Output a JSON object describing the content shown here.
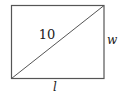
{
  "diagram": {
    "type": "rectangle-with-diagonal",
    "labels": {
      "diagonal": "10",
      "width": "w",
      "length": "l"
    },
    "colors": {
      "stroke": "#555555",
      "text": "#222222",
      "background": "#ffffff"
    }
  }
}
